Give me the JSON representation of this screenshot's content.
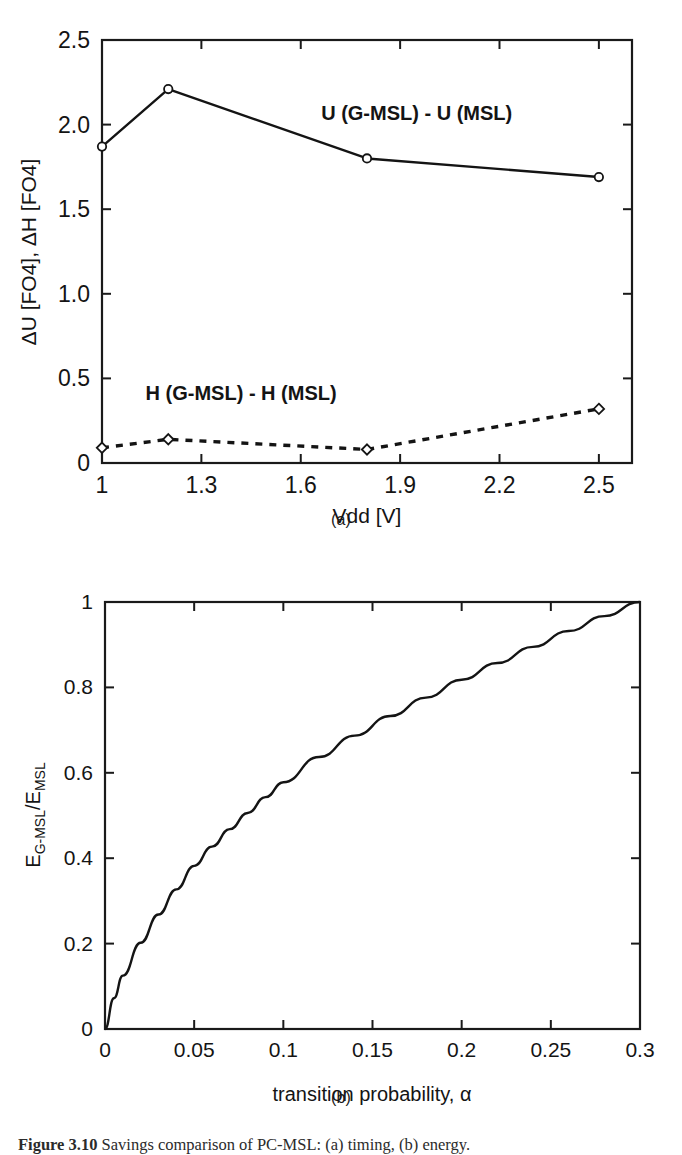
{
  "figure": {
    "caption_label": "Figure 3.10",
    "caption_text": "Savings  comparison  of  PC-MSL:  (a)  timing,  (b)  energy.",
    "subcaption_a": "(a)",
    "subcaption_b": "(b)"
  },
  "colors": {
    "ink": "#141414",
    "axis": "#1a1a1a",
    "background": "#ffffff"
  },
  "chart_data": [
    {
      "id": "panel-a",
      "type": "line",
      "title": "",
      "xlabel": "Vdd [V]",
      "ylabel": "ΔU [FO4], ΔH [FO4]",
      "xlim": [
        1.0,
        2.6
      ],
      "ylim": [
        0,
        2.5
      ],
      "grid": false,
      "legend": "inline-annotations",
      "xticks": [
        1.0,
        1.3,
        1.6,
        1.9,
        2.2,
        2.5
      ],
      "xticklabels": [
        "1",
        "1.3",
        "1.6",
        "1.9",
        "2.2",
        "2.5"
      ],
      "yticks": [
        0,
        0.5,
        1.0,
        1.5,
        2.0,
        2.5
      ],
      "yticklabels": [
        "0",
        "0.5",
        "1.0",
        "1.5",
        "2.0",
        "2.5"
      ],
      "x": [
        1.0,
        1.2,
        1.8,
        2.5
      ],
      "series": [
        {
          "name": "U (G-MSL) - U (MSL)",
          "label": "U (G-MSL) - U (MSL)",
          "linestyle": "solid",
          "marker": "circle",
          "values": [
            1.87,
            2.21,
            1.8,
            1.69
          ]
        },
        {
          "name": "H (G-MSL) - H (MSL)",
          "label": "H (G-MSL) - H (MSL)",
          "linestyle": "dashed",
          "marker": "diamond",
          "values": [
            0.09,
            0.14,
            0.08,
            0.32
          ]
        }
      ],
      "annotations": [
        {
          "text": "U (G-MSL) - U (MSL)",
          "x": 1.95,
          "y": 2.03
        },
        {
          "text": "H (G-MSL) - H (MSL)",
          "x": 1.42,
          "y": 0.37
        }
      ]
    },
    {
      "id": "panel-b",
      "type": "line",
      "title": "",
      "xlabel": "transition probability, α",
      "ylabel": "E(G-MSL)/E(MSL)",
      "ylabel_parts": {
        "base1": "E",
        "sub1": "G-MSL",
        "slash": "/",
        "base2": "E",
        "sub2": "MSL"
      },
      "xlim": [
        0,
        0.3
      ],
      "ylim": [
        0,
        1
      ],
      "grid": false,
      "xticks": [
        0,
        0.05,
        0.1,
        0.15,
        0.2,
        0.25,
        0.3
      ],
      "xticklabels": [
        "0",
        "0.05",
        "0.1",
        "0.15",
        "0.2",
        "0.25",
        "0.3"
      ],
      "yticks": [
        0,
        0.2,
        0.4,
        0.6,
        0.8,
        1
      ],
      "yticklabels": [
        "0",
        "0.2",
        "0.4",
        "0.6",
        "0.8",
        "1"
      ],
      "x": [
        0,
        0.005,
        0.01,
        0.02,
        0.03,
        0.04,
        0.05,
        0.06,
        0.07,
        0.08,
        0.09,
        0.1,
        0.12,
        0.14,
        0.16,
        0.18,
        0.2,
        0.22,
        0.24,
        0.26,
        0.28,
        0.3
      ],
      "series": [
        {
          "name": "E_G-MSL / E_MSL",
          "linestyle": "solid",
          "marker": "none",
          "values": [
            0.0,
            0.072,
            0.125,
            0.202,
            0.268,
            0.327,
            0.382,
            0.427,
            0.468,
            0.506,
            0.543,
            0.578,
            0.637,
            0.687,
            0.733,
            0.776,
            0.818,
            0.857,
            0.895,
            0.932,
            0.967,
            1.0
          ]
        }
      ]
    }
  ]
}
